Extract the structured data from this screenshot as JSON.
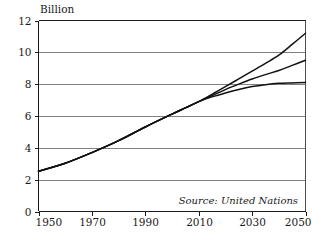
{
  "chart_data": {
    "type": "line",
    "title": "",
    "subtitle": "",
    "xlabel": "",
    "ylabel": "Billion",
    "unit_label": "Billion",
    "annotation": "Source: United Nations",
    "grid": "horizontal",
    "legend_position": "none",
    "xlim": [
      1950,
      2050
    ],
    "ylim": [
      0,
      12
    ],
    "x_ticks": [
      1950,
      1970,
      1990,
      2010,
      2030,
      2050
    ],
    "x_tick_labels": [
      "1950",
      "1970",
      "1990",
      "2010",
      "2030",
      "2050"
    ],
    "y_ticks": [
      0,
      2,
      4,
      6,
      8,
      10,
      12
    ],
    "y_tick_labels": [
      "0",
      "2",
      "4",
      "6",
      "8",
      "10",
      "12"
    ],
    "x": [
      1950,
      1960,
      1970,
      1980,
      1990,
      2000,
      2005,
      2010,
      2015,
      2020,
      2025,
      2030,
      2035,
      2040,
      2045,
      2050
    ],
    "series": [
      {
        "name": "High variant",
        "color": "#111111",
        "values": [
          2.53,
          3.03,
          3.7,
          4.45,
          5.31,
          6.12,
          6.51,
          6.9,
          7.36,
          7.84,
          8.33,
          8.82,
          9.31,
          9.82,
          10.5,
          11.2
        ]
      },
      {
        "name": "Medium variant",
        "color": "#111111",
        "values": [
          2.53,
          3.03,
          3.7,
          4.45,
          5.31,
          6.12,
          6.51,
          6.9,
          7.28,
          7.66,
          8.0,
          8.32,
          8.6,
          8.86,
          9.18,
          9.5
        ]
      },
      {
        "name": "Low variant",
        "color": "#111111",
        "values": [
          2.53,
          3.03,
          3.7,
          4.45,
          5.31,
          6.12,
          6.51,
          6.9,
          7.2,
          7.45,
          7.67,
          7.85,
          7.97,
          8.05,
          8.08,
          8.1
        ]
      }
    ]
  },
  "figure": {
    "unit_label": "Billion",
    "source_note": "Source: United Nations"
  }
}
